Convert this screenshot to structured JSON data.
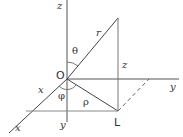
{
  "diagram": {
    "labels": {
      "z_axis": "z",
      "theta": "θ",
      "r": "r",
      "origin": "O",
      "z_height": "z",
      "x_axis_upper": "x",
      "phi": "φ",
      "rho": "ρ",
      "y_axis": "y",
      "x_axis_lower": "x",
      "y_length": "y",
      "point_L": "L"
    },
    "colors": {
      "line": "#444444",
      "axis": "#555555",
      "text": "#333333"
    }
  }
}
